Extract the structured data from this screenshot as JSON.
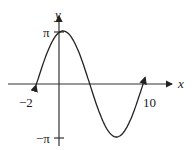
{
  "chart_data": {
    "type": "line",
    "title": "",
    "xlabel": "x",
    "ylabel": "y",
    "x_tick_labels": [
      "-2",
      "10"
    ],
    "y_tick_labels": [
      "π",
      "-π"
    ],
    "xlim": [
      -2,
      10
    ],
    "ylim": [
      -3.1416,
      3.1416
    ],
    "grid": false,
    "series": [
      {
        "name": "curve",
        "x": [
          -2,
          -1,
          0,
          0.5,
          1,
          2,
          3,
          4,
          5,
          6,
          7,
          8,
          9,
          10
        ],
        "y": [
          -1.05,
          1.2,
          2.95,
          3.14,
          3.07,
          2.43,
          1.35,
          0.0,
          -1.35,
          -2.5,
          -3.14,
          -2.8,
          -1.7,
          0.85
        ]
      }
    ]
  },
  "labels": {
    "x_axis": "x",
    "y_axis": "y",
    "pi": "π",
    "neg_pi": "−π",
    "neg_two": "−2",
    "ten": "10"
  }
}
